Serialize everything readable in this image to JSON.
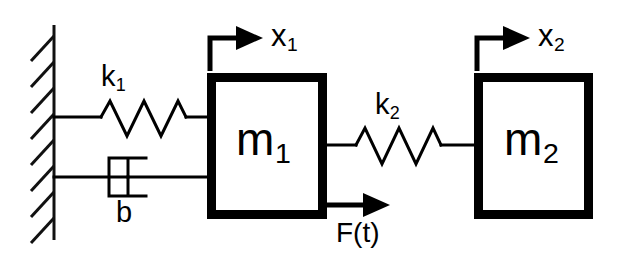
{
  "diagram": {
    "type": "free-body-schematic",
    "background_color": "#ffffff",
    "line_color": "#000000",
    "wall": {
      "name": "fixed-wall",
      "hatch_count": 8
    },
    "masses": [
      {
        "id": "m1",
        "label": "m",
        "subscript": "1",
        "x": 207,
        "y": 73,
        "width": 120,
        "height": 146
      },
      {
        "id": "m2",
        "label": "m",
        "subscript": "2",
        "x": 474,
        "y": 73,
        "width": 119,
        "height": 146
      }
    ],
    "springs": [
      {
        "id": "k1",
        "label": "k",
        "subscript": "1",
        "connects": "wall-to-m1",
        "coils": 3,
        "y": 117
      },
      {
        "id": "k2",
        "label": "k",
        "subscript": "2",
        "connects": "m1-to-m2",
        "coils": 3,
        "y": 145
      }
    ],
    "dampers": [
      {
        "id": "b",
        "label": "b",
        "subscript": "",
        "connects": "wall-to-m1",
        "y": 177
      }
    ],
    "coordinates": [
      {
        "id": "x1",
        "label": "x",
        "subscript": "1",
        "direction": "right",
        "attached_to": "m1"
      },
      {
        "id": "x2",
        "label": "x",
        "subscript": "2",
        "direction": "right",
        "attached_to": "m2"
      }
    ],
    "forces": [
      {
        "id": "F",
        "label": "F(t)",
        "direction": "right",
        "applied_to": "m1"
      }
    ]
  }
}
